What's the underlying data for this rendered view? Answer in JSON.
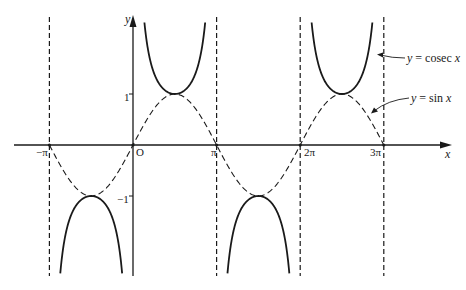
{
  "chart_data": {
    "type": "line",
    "title": "",
    "xlabel": "x",
    "ylabel": "y",
    "origin_label": "O",
    "x_ticks": [
      {
        "value": -3.14159,
        "label": "−π"
      },
      {
        "value": 3.14159,
        "label": "π"
      },
      {
        "value": 6.28319,
        "label": "2π"
      },
      {
        "value": 9.42478,
        "label": "3π"
      }
    ],
    "y_ticks": [
      {
        "value": 1,
        "label": "1"
      },
      {
        "value": -1,
        "label": "−1"
      }
    ],
    "xlim": [
      -3.6,
      11.1
    ],
    "ylim": [
      -2.5,
      2.5
    ],
    "grid": false,
    "legend": "inline annotations with arrows (right side)",
    "series": [
      {
        "name": "y = cosec x",
        "style": "solid",
        "function": "1/sin(x)",
        "branches": [
          {
            "x_range": [
              -3.14159,
              0
            ],
            "sign": "negative",
            "extremum": {
              "x": -1.5708,
              "y": -1
            }
          },
          {
            "x_range": [
              0,
              3.14159
            ],
            "sign": "positive",
            "extremum": {
              "x": 1.5708,
              "y": 1
            }
          },
          {
            "x_range": [
              3.14159,
              6.28319
            ],
            "sign": "negative",
            "extremum": {
              "x": 4.7124,
              "y": -1
            }
          },
          {
            "x_range": [
              6.28319,
              9.42478
            ],
            "sign": "positive",
            "extremum": {
              "x": 7.854,
              "y": 1
            }
          }
        ]
      },
      {
        "name": "y = sin x",
        "style": "dashed",
        "function": "sin(x)",
        "x_range": [
          -3.14159,
          9.42478
        ],
        "points": [
          {
            "x": -3.14159,
            "y": 0
          },
          {
            "x": -1.5708,
            "y": -1
          },
          {
            "x": 0,
            "y": 0
          },
          {
            "x": 1.5708,
            "y": 1
          },
          {
            "x": 3.14159,
            "y": 0
          },
          {
            "x": 4.7124,
            "y": -1
          },
          {
            "x": 6.28319,
            "y": 0
          },
          {
            "x": 7.854,
            "y": 1
          },
          {
            "x": 9.42478,
            "y": 0
          }
        ]
      }
    ],
    "asymptotes": {
      "style": "dashed vertical",
      "x": [
        -3.14159,
        3.14159,
        6.28319,
        9.42478
      ]
    },
    "annotations": [
      {
        "text_prefix": "y",
        "text_mid": " = cosec ",
        "text_var": "x",
        "points_to": "cosec curve near x≈2.9π"
      },
      {
        "text_prefix": "y",
        "text_mid": " = sin ",
        "text_var": "x",
        "points_to": "sin curve near x≈2.85π"
      }
    ]
  },
  "colors": {
    "ink": "#1a1a1a",
    "background": "#ffffff"
  }
}
